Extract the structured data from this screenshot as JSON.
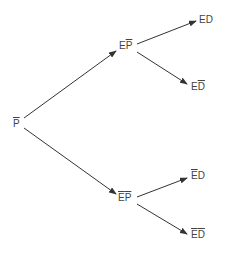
{
  "diagram": {
    "type": "probability-tree",
    "colors": {
      "line": "#333333",
      "text": "#444444",
      "background": "#ffffff"
    },
    "root": {
      "base": "P",
      "overline": true
    },
    "level1": [
      {
        "e": "E",
        "e_overline": false,
        "p": "P",
        "p_overline": true
      },
      {
        "e": "E",
        "e_overline": true,
        "p": "P",
        "p_overline": true
      }
    ],
    "leaves": [
      {
        "e": "E",
        "e_overline": false,
        "d": "D",
        "d_overline": false
      },
      {
        "e": "E",
        "e_overline": false,
        "d": "D",
        "d_overline": true
      },
      {
        "e": "E",
        "e_overline": true,
        "d": "D",
        "d_overline": false
      },
      {
        "e": "E",
        "e_overline": true,
        "d": "D",
        "d_overline": true
      }
    ]
  }
}
